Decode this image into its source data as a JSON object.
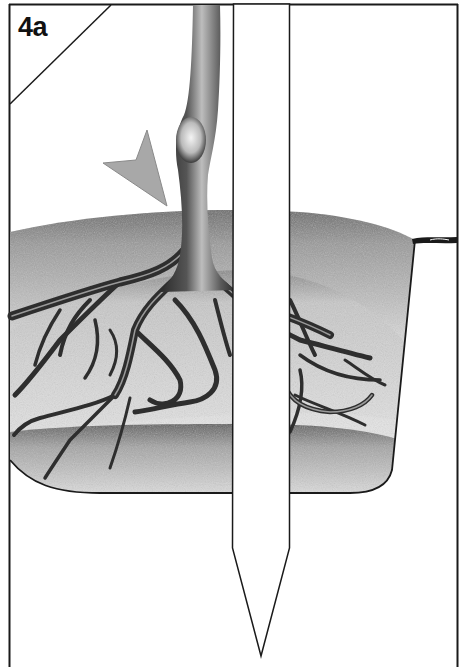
{
  "figure": {
    "panel_label": "4a",
    "colors": {
      "line": "#1a1a1a",
      "arrow_fill": "#a8a8a8",
      "soil_dark": "#6e6e6e",
      "soil_light": "#e6e6e6",
      "root": "#3a3a3a",
      "stake": "#ffffff",
      "background": "#ffffff"
    },
    "elements": {
      "frame": "border-frame",
      "corner_diagonal": "corner-diagonal-line",
      "stem": "tree-stem",
      "arrow": "root-collar-arrow",
      "root_ball": "root-ball",
      "roots": "root-system",
      "stake": "support-stake",
      "tie": "stake-tie"
    }
  }
}
